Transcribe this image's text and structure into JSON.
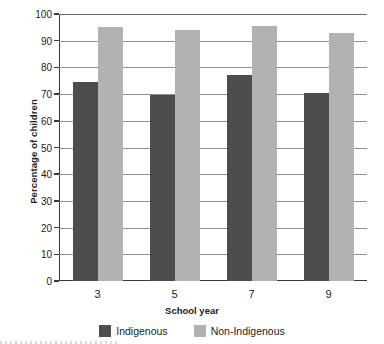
{
  "chart_data": {
    "type": "bar",
    "title": "",
    "xlabel": "School year",
    "ylabel": "Percentage of children",
    "categories": [
      "3",
      "5",
      "7",
      "9"
    ],
    "series": [
      {
        "name": "Indigenous",
        "color": "#4d4d4d",
        "values": [
          74.5,
          69.5,
          77,
          70.5
        ]
      },
      {
        "name": "Non-Indigenous",
        "color": "#b2b2b2",
        "values": [
          95,
          94,
          95.5,
          93
        ]
      }
    ],
    "ylim": [
      0,
      100
    ],
    "yticks": [
      0,
      10,
      20,
      30,
      40,
      50,
      60,
      70,
      80,
      90,
      100
    ],
    "ytick_labels": [
      "0",
      "10",
      "20",
      "30",
      "40",
      "50",
      "60",
      "70",
      "80",
      "90",
      "100"
    ],
    "grid": true,
    "grid_axis": "y",
    "legend_position": "bottom"
  }
}
